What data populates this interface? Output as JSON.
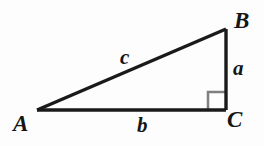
{
  "figure": {
    "kind": "geometry-diagram",
    "background_color": "#fdfdfd",
    "stroke_color": "#1a1a1a",
    "right_angle_color": "#808080",
    "label_color": "#151515"
  },
  "vertices": {
    "A": {
      "label": "A",
      "x": 37,
      "y": 110
    },
    "B": {
      "label": "B",
      "x": 226,
      "y": 29
    },
    "C": {
      "label": "C",
      "x": 226,
      "y": 110
    }
  },
  "sides": {
    "a": {
      "label": "a",
      "from": "B",
      "to": "C",
      "name": "opposite-leg"
    },
    "b": {
      "label": "b",
      "from": "A",
      "to": "C",
      "name": "adjacent-leg"
    },
    "c": {
      "label": "c",
      "from": "A",
      "to": "B",
      "name": "hypotenuse"
    }
  },
  "right_angle": {
    "at_vertex": "C",
    "marker": "square",
    "size": 18
  }
}
